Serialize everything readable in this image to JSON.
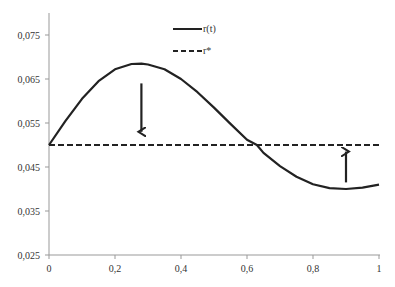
{
  "chart_data": {
    "type": "line",
    "title": "",
    "xlabel": "",
    "ylabel": "",
    "xlim": [
      0,
      1
    ],
    "ylim": [
      0.025,
      0.08
    ],
    "x_ticks": [
      "0",
      "0,2",
      "0,4",
      "0,6",
      "0,8",
      "1"
    ],
    "y_ticks": [
      "0,025",
      "0,035",
      "0,045",
      "0,055",
      "0,065",
      "0,075"
    ],
    "grid": false,
    "legend_position": "top-center",
    "series": [
      {
        "name": "r(t)",
        "style": "solid",
        "x": [
          0,
          0.05,
          0.1,
          0.15,
          0.2,
          0.25,
          0.28,
          0.3,
          0.35,
          0.4,
          0.45,
          0.5,
          0.55,
          0.6,
          0.63,
          0.65,
          0.7,
          0.75,
          0.8,
          0.85,
          0.9,
          0.95,
          1.0
        ],
        "values": [
          0.05,
          0.0555,
          0.0605,
          0.0645,
          0.0672,
          0.0684,
          0.0685,
          0.0683,
          0.0672,
          0.065,
          0.062,
          0.0585,
          0.0548,
          0.0512,
          0.05,
          0.0482,
          0.0452,
          0.0428,
          0.0411,
          0.0402,
          0.04,
          0.0403,
          0.041
        ]
      },
      {
        "name": "r*",
        "style": "dashed",
        "x": [
          0,
          1
        ],
        "values": [
          0.05,
          0.05
        ]
      }
    ],
    "annotations": [
      {
        "type": "arrow",
        "direction": "down",
        "x": 0.28,
        "from": 0.064,
        "to": 0.053
      },
      {
        "type": "arrow",
        "direction": "up",
        "x": 0.9,
        "from": 0.0415,
        "to": 0.0485
      }
    ]
  },
  "legend": {
    "items": [
      {
        "label": "r(t)",
        "style": "solid"
      },
      {
        "label": "r*",
        "style": "dashed"
      }
    ]
  }
}
